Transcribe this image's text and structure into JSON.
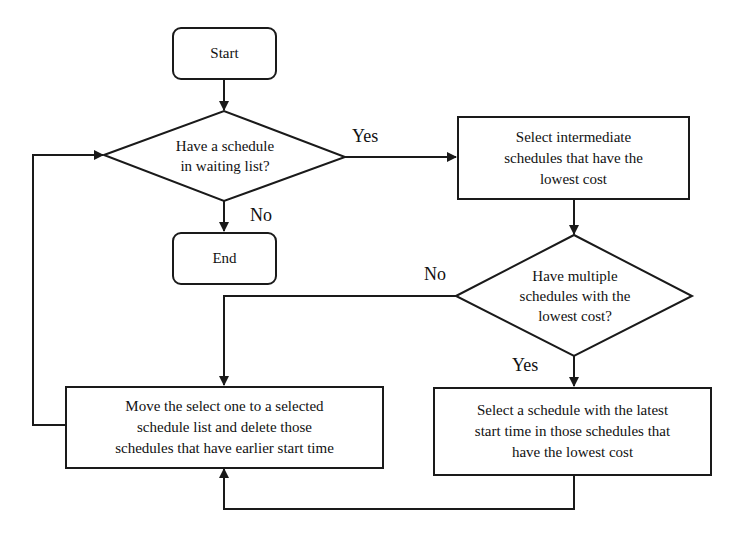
{
  "flowchart": {
    "start": {
      "label": "Start"
    },
    "end": {
      "label": "End"
    },
    "decision_waiting": {
      "line1": "Have a schedule",
      "line2": "in waiting list?"
    },
    "select_intermediate": {
      "line1": "Select intermediate",
      "line2": "schedules that have the",
      "line3": "lowest cost"
    },
    "decision_multiple": {
      "line1": "Have multiple",
      "line2": "schedules with the",
      "line3": "lowest cost?"
    },
    "move_selected": {
      "line1": "Move the select one to a selected",
      "line2": "schedule list and delete those",
      "line3": "schedules that have earlier start time"
    },
    "select_latest": {
      "line1": "Select a schedule with the latest",
      "line2": "start time in those schedules that",
      "line3": "have the lowest cost"
    },
    "edge_labels": {
      "waiting_yes": "Yes",
      "waiting_no": "No",
      "multiple_no": "No",
      "multiple_yes": "Yes"
    },
    "colors": {
      "stroke": "#1a1a1a",
      "background": "#ffffff"
    }
  }
}
